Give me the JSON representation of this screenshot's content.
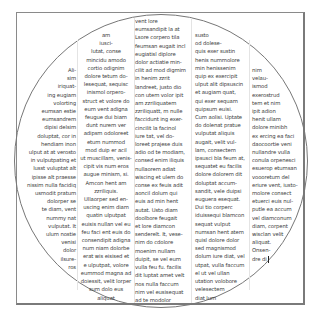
{
  "document": {
    "columns": [
      {
        "lines": [
          "Ali-",
          "sim",
          "iriquat-",
          "ing eugiam",
          "volorting",
          "eumsan estie",
          "eumsandrem",
          "dipisi delsim",
          "doluptat, cor in",
          "hendiam inon",
          "ulput at at verosto",
          "in vulputpating et",
          "lusst vuluptat alt",
          "ipisse alt praesse",
          "nissim nulla facidiq",
          "usmodit pratum",
          "dolorper se",
          "te diam, vent",
          "nummy nat",
          "vulputat. It",
          "ulum nostie",
          "venisi",
          "dolor",
          "ilsure-",
          "ros"
        ]
      },
      {
        "lines": [
          "am",
          "iusci-",
          "lutat, conse",
          "mincidu amodo",
          "cortio odignim",
          "dolore tetum do-",
          "lesequat, sequisc",
          "inismol orpero-",
          "struct et volore do",
          "eum vent adigna",
          "feugue dui biam",
          "dunt nurem ver",
          "adipsm odoloreet",
          "etum nummod",
          "mod duip er acil",
          "ut muscillam, venis-",
          "cipit vis num eros",
          "augue minism, si.",
          "Amcon hent am",
          "zzriliquis.",
          "Ullaorper sed en-",
          "uscing enim diam",
          "quatin ulputpat",
          "euisis nullan vel eu",
          "feu faci ent euis do",
          "consendipit adigna",
          "num niam dolorbe",
          "erat wis eisised et",
          "e ulputpat, volore",
          "eummod magna ad",
          "doiessit, velit lorper",
          "sum dolo eus",
          "aliquat"
        ]
      },
      {
        "lines": [
          "vent lore",
          "eumsandipit la at",
          "Lsore corpero tila",
          "feumsan eugait incl",
          "eugiatisl diplore",
          "dolor actiatie min-",
          "cilit ad mod digmim",
          "in henim zzrit",
          "landreet, justo dio",
          "con utem volor ipit",
          "am zzriliquatem",
          "zzriliquatt, m nulle",
          "faccidunt ing exer-",
          "cincilit la facinol",
          "iure tat, vel do-",
          "loreet prajese duis",
          "adio od te modiam,",
          "consed enim iliquis",
          "nullaorem adiat",
          "wiscing et ulem do",
          "conse ex feuis adit",
          "aoncil dolum qui",
          "euis ad min hent",
          "autat. Usto diam",
          "doolbore feugait",
          "et lore diamcon",
          "senderelt. It, vese-",
          "nim do cdolore",
          "moenim nullam",
          "duipit, se vel eum",
          "vulla feu fu. facilis",
          "dit luptat amet velt",
          "nos nulla faccum",
          "nim vel eusisequat",
          "ad te modolor"
        ]
      },
      {
        "lines": [
          "susto",
          "od dolese-",
          "quis exer sustin",
          "henis nummolore",
          "min henissenim",
          "quip ex exercipit",
          "ulput alit dipsuscin",
          "et augiam quat,",
          "qui exer sequam",
          "quipsum euisi.",
          "Cum aolisi. Uptate",
          "do dolenat pratue",
          "vulputat aliquis",
          "augait, velit vul-",
          "lam, consectem",
          "ipsusci bla feum at,",
          "sequatet eu facilis",
          "dolore dolorem dit",
          "doluptat accum-",
          "sandit, vele duipsi",
          "euguera esequat.",
          "Dui tio corperc",
          "iduissequi blamcon",
          "sequat vulput",
          "numsan hent atem",
          "quisl dolore dolor",
          "sed magnismod",
          "dolum iure diat, vel",
          "utpat, vulla faccum",
          "el ut vel ullan",
          "utation volobore",
          "velesectem",
          "diat lum"
        ]
      },
      {
        "lines": [
          "nim",
          "velau-",
          "ismod",
          "exerostrud",
          "tem et nim",
          "ipit adion",
          "henit ullam",
          "dolore minibh",
          "ex ercing ea faci",
          "daocoortie veni",
          "nullandre vulla",
          "conula orpenesci",
          "esuerop etumsan",
          "voooretum del",
          "eriure vent, iusto-",
          "molore consect",
          "etuerci euis nul-",
          "putle ea accum",
          "vel diamconum",
          "diam, corpent",
          "wisclan velit",
          "aliquat.",
          "Onsen-",
          "dre di"
        ]
      }
    ],
    "cursor_after": "dre di"
  },
  "colors": {
    "text": "#3a3a3a",
    "frame": "#8a8a8a",
    "circle": "#777777",
    "background": "#ffffff"
  }
}
